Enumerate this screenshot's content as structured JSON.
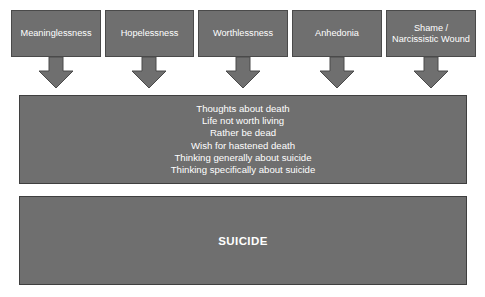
{
  "diagram": {
    "background_color": "#ffffff",
    "box_fill_color": "#6f6f6f",
    "box_border_color": "#4a4a4a",
    "text_color": "#ffffff",
    "arrow_color": "#6f6f6f",
    "arrow_border_color": "#4a4a4a"
  },
  "factors": [
    {
      "label": "Meaninglessness",
      "x": 11,
      "width": 90
    },
    {
      "label": "Hopelessness",
      "x": 105,
      "width": 89
    },
    {
      "label": "Worthlessness",
      "x": 198,
      "width": 90
    },
    {
      "label": "Anhedonia",
      "x": 292,
      "width": 90
    },
    {
      "label": "Shame / Narcissistic Wound",
      "x": 386,
      "width": 90
    }
  ],
  "arrows": [
    {
      "name": "arrow-meaninglessness",
      "x": 38
    },
    {
      "name": "arrow-hopelessness",
      "x": 131
    },
    {
      "name": "arrow-worthlessness",
      "x": 225
    },
    {
      "name": "arrow-anhedonia",
      "x": 319
    },
    {
      "name": "arrow-shame",
      "x": 413
    }
  ],
  "thoughts": {
    "lines": [
      "Thoughts about death",
      "Life not worth living",
      "Rather be dead",
      "Wish for hastened death",
      "Thinking generally about suicide",
      "Thinking specifically about suicide"
    ]
  },
  "outcome": {
    "label": "SUICIDE"
  }
}
